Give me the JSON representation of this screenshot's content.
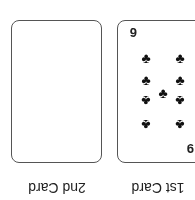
{
  "orientation": "rotated-180",
  "cards": [
    {
      "label": "1st Card",
      "rank": "9",
      "suit": "clubs",
      "suit_glyph": "♣",
      "pips": 9
    },
    {
      "label": "2nd Card",
      "rank": "",
      "suit": "",
      "face": "blank"
    }
  ]
}
